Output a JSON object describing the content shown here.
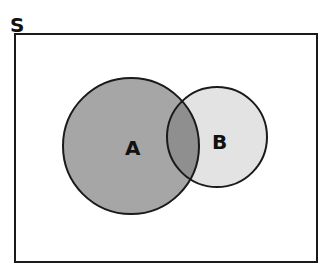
{
  "diagram": {
    "type": "venn",
    "universe_label": "S",
    "sets": [
      {
        "name": "A",
        "label": "A",
        "fill": "#a6a6a6"
      },
      {
        "name": "B",
        "label": "B",
        "fill": "#e3e3e3"
      }
    ],
    "intersection_fill": "#8f8f8f",
    "stroke": "#1a1a1a"
  }
}
